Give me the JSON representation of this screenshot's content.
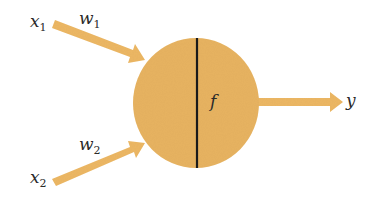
{
  "diagram": {
    "type": "artificial neuron (perceptron)",
    "colors": {
      "neuron_fill": "#E8B462",
      "arrow_fill": "#EDB865",
      "divider": "#1a1a1a",
      "text": "#2a2a2a",
      "background": "#ffffff"
    },
    "inputs": [
      {
        "label": "x",
        "subscript": "1",
        "weight_label": "w",
        "weight_subscript": "1"
      },
      {
        "label": "x",
        "subscript": "2",
        "weight_label": "w",
        "weight_subscript": "2"
      }
    ],
    "neuron": {
      "function_label": "f"
    },
    "output": {
      "label": "y"
    }
  }
}
